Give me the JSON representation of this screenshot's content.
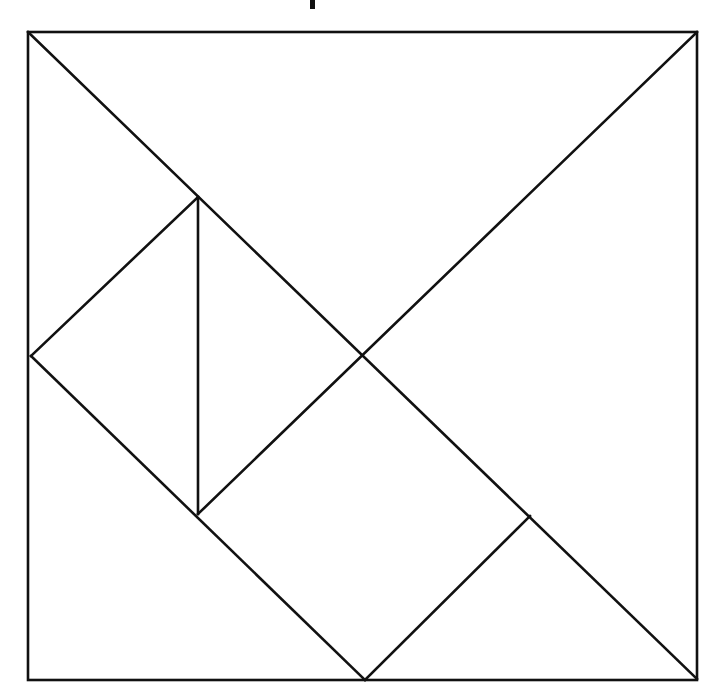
{
  "page": {
    "background_color": "#ffffff",
    "width": 725,
    "height": 699,
    "caption": ""
  },
  "figure": {
    "name": "tangram-square-dissection",
    "stroke_color": "#111111",
    "stroke_width": 2.6,
    "fill_color": "none",
    "square": {
      "left": 28,
      "top": 32,
      "right": 697,
      "bottom": 680,
      "width": 669,
      "height": 648
    },
    "vertices": [
      {
        "id": "A",
        "label": "top-left-corner",
        "x": 28,
        "y": 32
      },
      {
        "id": "B",
        "label": "top-right-corner",
        "x": 697,
        "y": 32
      },
      {
        "id": "C",
        "label": "bottom-right-corner",
        "x": 697,
        "y": 680
      },
      {
        "id": "D",
        "label": "bottom-left-corner",
        "x": 28,
        "y": 680
      },
      {
        "id": "E",
        "label": "left-edge-midpoint",
        "x": 31,
        "y": 356
      },
      {
        "id": "F",
        "label": "upper-inner-node",
        "x": 198,
        "y": 197
      },
      {
        "id": "G",
        "label": "center-crossing",
        "x": 362,
        "y": 355
      },
      {
        "id": "H",
        "label": "lower-inner-node",
        "x": 198,
        "y": 514
      },
      {
        "id": "I",
        "label": "bottom-edge-midpoint",
        "x": 365,
        "y": 680
      },
      {
        "id": "J",
        "label": "right-lower-node",
        "x": 530,
        "y": 516
      }
    ],
    "segments": [
      {
        "name": "outer-square-top",
        "from": "A",
        "to": "B"
      },
      {
        "name": "outer-square-right",
        "from": "B",
        "to": "C"
      },
      {
        "name": "outer-square-bottom",
        "from": "C",
        "to": "D"
      },
      {
        "name": "outer-square-left",
        "from": "D",
        "to": "A"
      },
      {
        "name": "main-diagonal",
        "from": "A",
        "to": "C"
      },
      {
        "name": "anti-diagonal-upper",
        "from": "B",
        "to": "H"
      },
      {
        "name": "upper-left-edge",
        "from": "F",
        "to": "E"
      },
      {
        "name": "left-to-bottom-diagonal",
        "from": "E",
        "to": "I"
      },
      {
        "name": "vertical-divider",
        "from": "F",
        "to": "H"
      },
      {
        "name": "bottom-right-edge",
        "from": "I",
        "to": "J"
      }
    ],
    "paths": {
      "outer_square": "M 28 32 L 697 32 L 697 680 L 28 680 Z",
      "main_diagonal": "M 28 32 L 697 679",
      "anti_diagonal_upper": "M 697 32 L 198 514",
      "upper_left_edge": "M 198 197 L 31 356",
      "left_to_bottom_diagonal": "M 31 356 L 365 680",
      "vertical_divider": "M 198 197 L 198 514",
      "bottom_right_edge": "M 365 680 L 530 516"
    }
  },
  "artifacts": {
    "crop_mark": {
      "name": "page-crop-mark",
      "x": 310,
      "y": 0,
      "width": 5,
      "height": 9,
      "color": "#111111"
    }
  }
}
